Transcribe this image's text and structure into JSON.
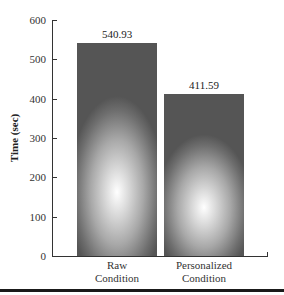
{
  "chart_data": {
    "type": "bar",
    "title": "",
    "xlabel": "",
    "ylabel": "Time (sec)",
    "categories": [
      "Raw Condition",
      "Personalized Condition"
    ],
    "category_lines": [
      [
        "Raw",
        "Condition"
      ],
      [
        "Personalized",
        "Condition"
      ]
    ],
    "values": [
      540.93,
      411.59
    ],
    "value_labels": [
      "540.93",
      "411.59"
    ],
    "ylim": [
      0,
      600
    ],
    "yticks": [
      0,
      100,
      200,
      300,
      400,
      500,
      600
    ],
    "ytick_labels": [
      "0",
      "100",
      "200",
      "300",
      "400",
      "500",
      "600"
    ],
    "grid": false,
    "legend": null,
    "bar_style": "radial gray gradient"
  },
  "axis": {
    "y_title": "Time (sec)"
  },
  "colors": {
    "axis": "#333333",
    "bar_dark": "#555555",
    "bar_light": "#ffffff",
    "rule": "#1a1a1a"
  }
}
